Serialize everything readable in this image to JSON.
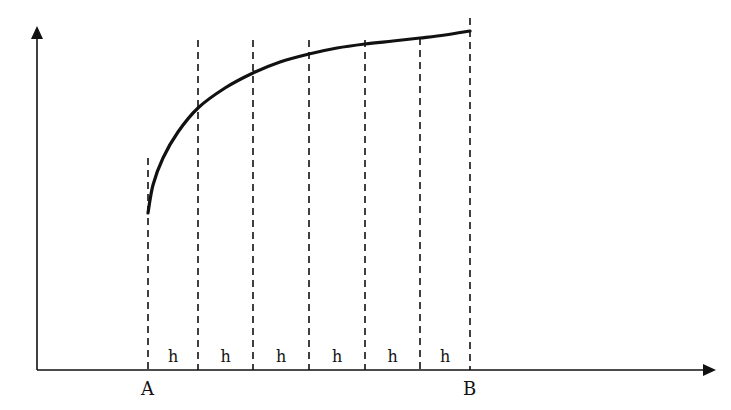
{
  "diagram": {
    "type": "function-interval-partition",
    "axes": {
      "x_axis": {
        "from": [
          37,
          370
        ],
        "to": [
          715,
          370
        ],
        "arrow": true
      },
      "y_axis": {
        "from": [
          37,
          370
        ],
        "to": [
          37,
          28
        ],
        "arrow": true
      }
    },
    "points": {
      "A": {
        "label": "A",
        "x": 148
      },
      "B": {
        "label": "B",
        "x": 470
      }
    },
    "partition_lines_x": [
      148,
      198,
      253,
      309,
      365,
      420,
      470
    ],
    "partition_tops_y": [
      158,
      40,
      40,
      40,
      40,
      38,
      18
    ],
    "step_label": "h",
    "step_labels": [
      "h",
      "h",
      "h",
      "h",
      "h",
      "h"
    ],
    "curve_points": [
      [
        148,
        213
      ],
      [
        153,
        185
      ],
      [
        163,
        158
      ],
      [
        178,
        132
      ],
      [
        198,
        108
      ],
      [
        225,
        88
      ],
      [
        253,
        73
      ],
      [
        280,
        62
      ],
      [
        309,
        54
      ],
      [
        337,
        48
      ],
      [
        365,
        44
      ],
      [
        393,
        41
      ],
      [
        420,
        38
      ],
      [
        445,
        35
      ],
      [
        470,
        31
      ]
    ],
    "colors": {
      "stroke": "#111111",
      "background": "#ffffff"
    }
  }
}
